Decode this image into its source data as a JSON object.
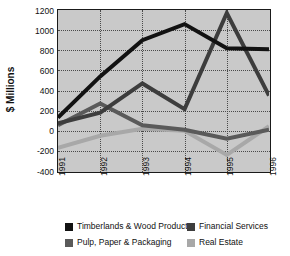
{
  "chart_data": {
    "type": "line",
    "title": "",
    "xlabel": "",
    "ylabel": "$ Millions",
    "categories": [
      "1991",
      "1992",
      "1993",
      "1994",
      "1995",
      "1996"
    ],
    "ylim": [
      -400,
      1200
    ],
    "yticks": [
      1200,
      1000,
      800,
      600,
      400,
      200,
      0,
      -200,
      -400
    ],
    "ytick_labels": [
      "1200",
      "1000",
      "800",
      "600",
      "400",
      "200",
      "0",
      "-200",
      "-400"
    ],
    "grid": true,
    "legend_position": "bottom",
    "series": [
      {
        "name": "Timberlands & Wood Products",
        "color": "#121212",
        "values": [
          130,
          540,
          900,
          1060,
          820,
          810
        ]
      },
      {
        "name": "Pulp, Paper & Packaging",
        "color": "#5a5a5a",
        "values": [
          55,
          270,
          55,
          10,
          -80,
          10
        ]
      },
      {
        "name": "Financial Services",
        "color": "#3d3d3d",
        "values": [
          75,
          180,
          470,
          215,
          1170,
          350
        ]
      },
      {
        "name": "Real Estate",
        "color": "#a8a8a8",
        "values": [
          -170,
          -50,
          20,
          0,
          -240,
          45
        ]
      }
    ]
  },
  "legend": {
    "items": [
      {
        "label": "Timberlands & Wood Products",
        "color": "#121212"
      },
      {
        "label": "Pulp, Paper & Packaging",
        "color": "#5a5a5a"
      },
      {
        "label": "Financial Services",
        "color": "#3d3d3d"
      },
      {
        "label": "Real Estate",
        "color": "#a8a8a8"
      }
    ]
  }
}
